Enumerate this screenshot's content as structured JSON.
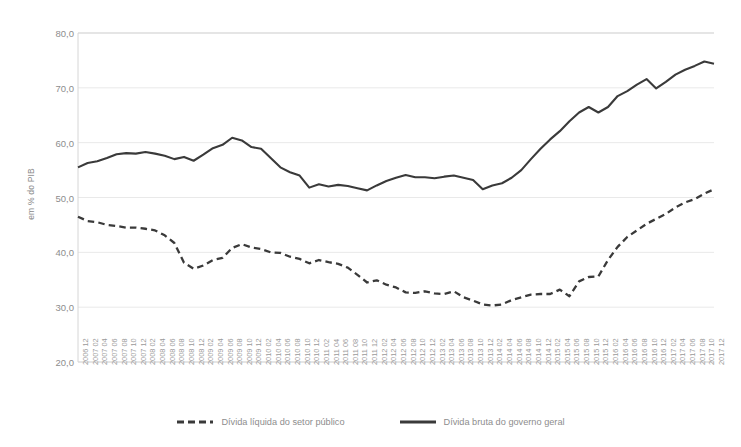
{
  "axis": {
    "y_title": "em % do PIB",
    "y_ticks": [
      "20,0",
      "30,0",
      "40,0",
      "50,0",
      "60,0",
      "70,0",
      "80,0"
    ]
  },
  "legend": {
    "items": [
      {
        "label": "Dívida líquida do setor público",
        "style": "dashed",
        "color": "#3a3a3a",
        "icon": "dashed-line-swatch"
      },
      {
        "label": "Dívida bruta do governo geral",
        "style": "solid",
        "color": "#3a3a3a",
        "icon": "solid-line-swatch"
      }
    ]
  },
  "colors": {
    "series": "#3a3a3a",
    "grid": "#e9e9e9",
    "axis": "#d6d6d6",
    "tick_text": "#8d8d8d",
    "background": "#ffffff"
  },
  "chart_data": {
    "type": "line",
    "title": "",
    "xlabel": "",
    "ylabel": "em % do PIB",
    "ylim": [
      20.0,
      80.0
    ],
    "ytick_step": 10.0,
    "grid": true,
    "legend_position": "bottom",
    "x": [
      "2006 12",
      "2007 02",
      "2007 04",
      "2007 06",
      "2007 08",
      "2007 10",
      "2007 12",
      "2008 02",
      "2008 04",
      "2008 06",
      "2008 08",
      "2008 10",
      "2008 12",
      "2009 02",
      "2009 04",
      "2009 06",
      "2009 08",
      "2009 10",
      "2009 12",
      "2010 02",
      "2010 04",
      "2010 06",
      "2010 08",
      "2010 10",
      "2010 12",
      "2011 02",
      "2011 04",
      "2011 06",
      "2011 08",
      "2011 10",
      "2011 12",
      "2012 02",
      "2012 04",
      "2012 06",
      "2012 08",
      "2012 10",
      "2012 12",
      "2013 02",
      "2013 04",
      "2013 06",
      "2013 08",
      "2013 10",
      "2013 12",
      "2014 02",
      "2014 04",
      "2014 06",
      "2014 08",
      "2014 10",
      "2014 12",
      "2015 02",
      "2015 04",
      "2015 06",
      "2015 08",
      "2015 10",
      "2015 12",
      "2016 02",
      "2016 04",
      "2016 06",
      "2016 08",
      "2016 10",
      "2016 12",
      "2017 02",
      "2017 04",
      "2017 06",
      "2017 08",
      "2017 10",
      "2017 12"
    ],
    "series": [
      {
        "name": "Dívida bruta do governo geral",
        "style": "solid",
        "values": [
          55.5,
          56.3,
          56.6,
          57.2,
          57.9,
          58.1,
          58.0,
          58.3,
          58.0,
          57.6,
          57.0,
          57.4,
          56.7,
          57.8,
          59.0,
          59.6,
          60.9,
          60.4,
          59.2,
          58.9,
          57.2,
          55.5,
          54.6,
          54.0,
          51.8,
          52.4,
          52.0,
          52.3,
          52.1,
          51.7,
          51.3,
          52.2,
          53.0,
          53.6,
          54.1,
          53.7,
          53.7,
          53.5,
          53.8,
          54.0,
          53.6,
          53.2,
          51.5,
          52.2,
          52.6,
          53.6,
          55.0,
          57.0,
          58.9,
          60.6,
          62.1,
          63.9,
          65.5,
          66.5,
          65.5,
          66.5,
          68.5,
          69.4,
          70.6,
          71.6,
          69.9,
          71.1,
          72.4,
          73.3,
          74.0,
          74.8,
          74.4
        ]
      },
      {
        "name": "Dívida líquida do setor público",
        "style": "dashed",
        "values": [
          46.5,
          45.7,
          45.5,
          45.0,
          44.8,
          44.5,
          44.5,
          44.3,
          44.0,
          43.1,
          41.7,
          38.1,
          37.0,
          37.6,
          38.6,
          39.0,
          40.8,
          41.5,
          40.9,
          40.6,
          40.0,
          39.9,
          39.2,
          38.8,
          38.0,
          38.6,
          38.2,
          37.9,
          37.2,
          35.9,
          34.5,
          34.9,
          34.1,
          33.6,
          32.7,
          32.6,
          32.9,
          32.5,
          32.4,
          32.9,
          31.8,
          31.2,
          30.5,
          30.3,
          30.5,
          31.3,
          31.8,
          32.3,
          32.4,
          32.4,
          33.2,
          32.0,
          34.7,
          35.5,
          35.6,
          38.6,
          41.0,
          42.8,
          44.0,
          45.2,
          46.1,
          47.0,
          48.2,
          49.1,
          49.7,
          50.7,
          51.5
        ]
      }
    ]
  }
}
